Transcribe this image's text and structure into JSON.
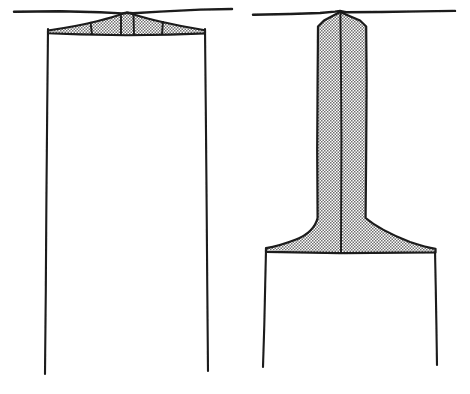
{
  "figure": {
    "style": "black ink line drawing with stippled gray fill",
    "canvas": {
      "width": 470,
      "height": 394,
      "background": "#ffffff"
    },
    "ink_color": "#1a1a1a",
    "fill_color": "#9d9d9d",
    "panels": [
      {
        "id": "left-panel",
        "name": "wide-ceiling-jet-panel",
        "description": "Flat wide plume spreading horizontally under a ceiling between two vertical walls",
        "ceiling_line": {
          "x1": 14,
          "y1": 11.5,
          "x2": 232,
          "y2": 9.0
        },
        "apex": {
          "x": 127,
          "y": 13
        },
        "plume_outline": [
          [
            48,
            31
          ],
          [
            70,
            26
          ],
          [
            96,
            21
          ],
          [
            127,
            13
          ],
          [
            158,
            20
          ],
          [
            186,
            26
          ],
          [
            205,
            30
          ],
          [
            205,
            33
          ],
          [
            170,
            34
          ],
          [
            127,
            35
          ],
          [
            80,
            34
          ],
          [
            48,
            33
          ]
        ],
        "divider_lines": [
          {
            "x1": 90,
            "y1": 21.5,
            "x2": 92,
            "y2": 34.5
          },
          {
            "x1": 121,
            "y1": 15.0,
            "x2": 121,
            "y2": 35.0
          },
          {
            "x1": 133,
            "y1": 15.0,
            "x2": 134,
            "y2": 35.0
          },
          {
            "x1": 163,
            "y1": 21.0,
            "x2": 162,
            "y2": 34.5
          }
        ],
        "left_wall": {
          "x1": 48,
          "y1": 29,
          "x2": 45,
          "y2": 374
        },
        "right_wall": {
          "x1": 205,
          "y1": 29,
          "x2": 208,
          "y2": 371
        }
      },
      {
        "id": "right-panel",
        "name": "vertical-column-plume-panel",
        "description": "Narrow vertical plume descending from ceiling then spreading into a wide flange above a floor gap",
        "ceiling_line": {
          "x1": 253,
          "y1": 14.5,
          "x2": 455,
          "y2": 11.0
        },
        "apex": {
          "x": 340,
          "y": 11
        },
        "column_left_x": 318,
        "column_right_x": 365,
        "column_center_x": 341,
        "flange_top_y": 222,
        "flange_base_y": 251,
        "flange_left_x": 266,
        "flange_right_x": 435,
        "plume_outline": [
          [
            340,
            11
          ],
          [
            366,
            24
          ],
          [
            367,
            120
          ],
          [
            366,
            222
          ],
          [
            400,
            238
          ],
          [
            435,
            248
          ],
          [
            435,
            252
          ],
          [
            341,
            253
          ],
          [
            266,
            252
          ],
          [
            266,
            248
          ],
          [
            296,
            238
          ],
          [
            318,
            222
          ],
          [
            317,
            120
          ],
          [
            317,
            24
          ]
        ],
        "center_line": {
          "x1": 341,
          "y1": 14,
          "x2": 341,
          "y2": 252
        },
        "left_wall": {
          "x1": 266,
          "y1": 250,
          "x2": 263,
          "y2": 367
        },
        "right_wall": {
          "x1": 435,
          "y1": 250,
          "x2": 437,
          "y2": 365
        }
      }
    ]
  }
}
